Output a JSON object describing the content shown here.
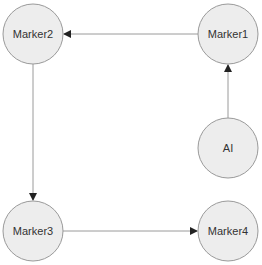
{
  "diagram": {
    "nodes": [
      {
        "id": "marker2",
        "label": "Marker2",
        "cx": 33,
        "cy": 34,
        "r": 30
      },
      {
        "id": "marker1",
        "label": "Marker1",
        "cx": 228,
        "cy": 34,
        "r": 30
      },
      {
        "id": "ai",
        "label": "AI",
        "cx": 228,
        "cy": 148,
        "r": 30
      },
      {
        "id": "marker3",
        "label": "Marker3",
        "cx": 33,
        "cy": 231,
        "r": 30
      },
      {
        "id": "marker4",
        "label": "Marker4",
        "cx": 228,
        "cy": 231,
        "r": 30
      }
    ],
    "edges": [
      {
        "from": "marker1",
        "to": "marker2"
      },
      {
        "from": "ai",
        "to": "marker1"
      },
      {
        "from": "marker2",
        "to": "marker3"
      },
      {
        "from": "marker3",
        "to": "marker4"
      }
    ],
    "colors": {
      "node_fill": "#ededed",
      "node_stroke": "#9a9a9a",
      "edge": "#9a9a9a",
      "arrow": "#222222",
      "text": "#333333"
    }
  }
}
